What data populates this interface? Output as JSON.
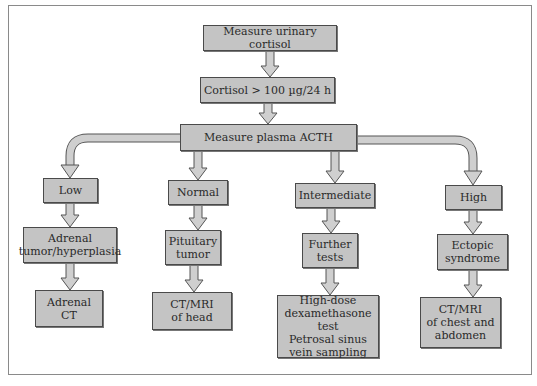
{
  "colors": {
    "box_fill": "#c4c4c4",
    "box_border": "#4a4a4a",
    "arrow_fill": "#cfcfcf",
    "arrow_stroke": "#555555",
    "frame": "#8a8a8a"
  },
  "nodes": {
    "start": "Measure urinary cortisol",
    "cortisol": "Cortisol > 100 µg/24 h",
    "acth": "Measure plasma ACTH",
    "low": "Low",
    "normal": "Normal",
    "intermediate": "Intermediate",
    "high": "High",
    "adrenal_tumor": "Adrenal\ntumor/hyperplasia",
    "pituitary_tumor": "Pituitary\ntumor",
    "further_tests": "Further\ntests",
    "ectopic": "Ectopic\nsyndrome",
    "adrenal_ct": "Adrenal\nCT",
    "ct_mri_head": "CT/MRI\nof head",
    "high_dose": "High-dose\ndexamethasone test\nPetrosal sinus\nvein sampling",
    "ct_mri_chest": "CT/MRI\nof chest and\nabdomen"
  },
  "edges": [
    [
      "start",
      "cortisol"
    ],
    [
      "cortisol",
      "acth"
    ],
    [
      "acth",
      "low"
    ],
    [
      "acth",
      "normal"
    ],
    [
      "acth",
      "intermediate"
    ],
    [
      "acth",
      "high"
    ],
    [
      "low",
      "adrenal_tumor"
    ],
    [
      "normal",
      "pituitary_tumor"
    ],
    [
      "intermediate",
      "further_tests"
    ],
    [
      "high",
      "ectopic"
    ],
    [
      "adrenal_tumor",
      "adrenal_ct"
    ],
    [
      "pituitary_tumor",
      "ct_mri_head"
    ],
    [
      "further_tests",
      "high_dose"
    ],
    [
      "ectopic",
      "ct_mri_chest"
    ]
  ]
}
